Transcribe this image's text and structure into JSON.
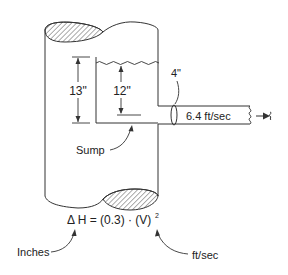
{
  "diagram": {
    "labels": {
      "total_height": "13\"",
      "water_depth": "12\"",
      "pipe_diameter": "4\"",
      "velocity": "6.4 ft/sec",
      "sump": "Sump",
      "equation": "Δ H = (0.3) · (V)",
      "equation_exponent": "2",
      "inches": "Inches",
      "ftsec": "ft/sec"
    },
    "colors": {
      "line": "#333333",
      "hatch": "#444444",
      "background": "#ffffff"
    }
  }
}
